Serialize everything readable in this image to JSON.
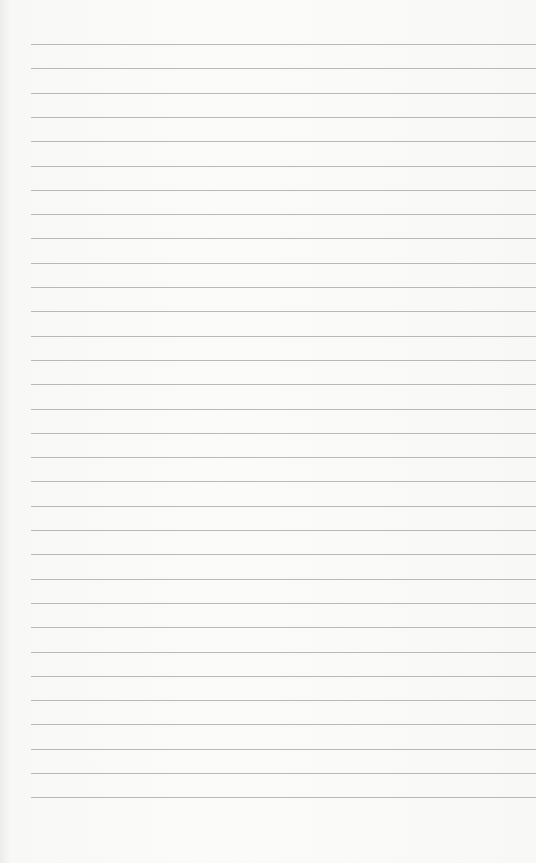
{
  "page": {
    "type": "ruled-notepad-paper",
    "line_count": 32,
    "first_line_y": 44,
    "line_spacing": 24.3,
    "line_left_x": 31,
    "line_color": "#b9b9b9",
    "paper_color": "#f9f9f8"
  }
}
